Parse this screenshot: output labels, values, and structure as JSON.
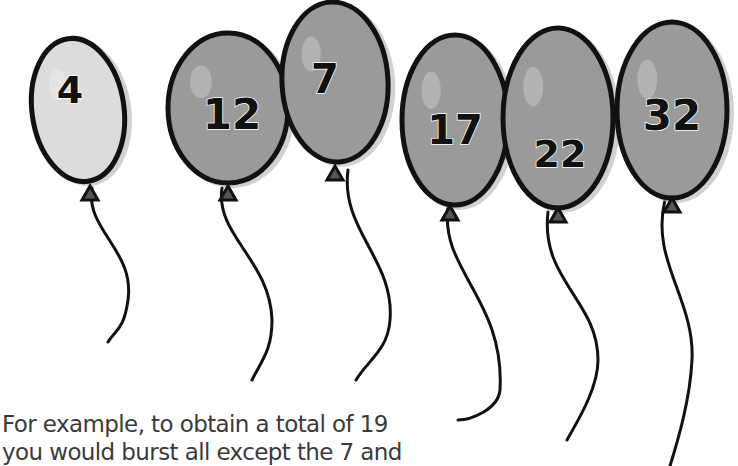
{
  "balloons": [
    {
      "label": "4",
      "shade": "#dcdcdc"
    },
    {
      "label": "12",
      "shade": "#9a9a9a"
    },
    {
      "label": "7",
      "shade": "#9a9a9a"
    },
    {
      "label": "17",
      "shade": "#9a9a9a"
    },
    {
      "label": "22",
      "shade": "#9a9a9a"
    },
    {
      "label": "32",
      "shade": "#9a9a9a"
    }
  ],
  "caption": {
    "line1": "For example, to obtain a total of 19",
    "line2": "you would burst all except the 7 and"
  }
}
